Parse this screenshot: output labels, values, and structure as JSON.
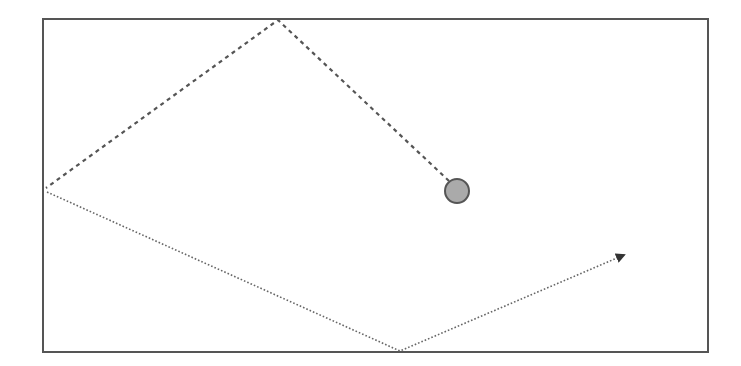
{
  "diagram": {
    "type": "ball-bounce-trajectory",
    "box": {
      "x": 43,
      "y": 19,
      "width": 665,
      "height": 333,
      "stroke": "#555555"
    },
    "ball": {
      "cx": 457,
      "cy": 191,
      "r": 12,
      "fill": "#aaaaaa",
      "stroke": "#555555"
    },
    "dashed_path": {
      "description": "incoming path (dashed)",
      "points": [
        [
          449,
          181
        ],
        [
          278,
          20
        ],
        [
          46,
          188
        ]
      ],
      "stroke": "#555555"
    },
    "dotted_path": {
      "description": "outgoing path (dotted) ending in arrow",
      "points": [
        [
          47,
          192
        ],
        [
          400,
          351
        ],
        [
          632,
          251
        ]
      ],
      "stroke": "#555555"
    },
    "arrowhead": {
      "tip": [
        632,
        251
      ],
      "fill": "#333333"
    }
  }
}
